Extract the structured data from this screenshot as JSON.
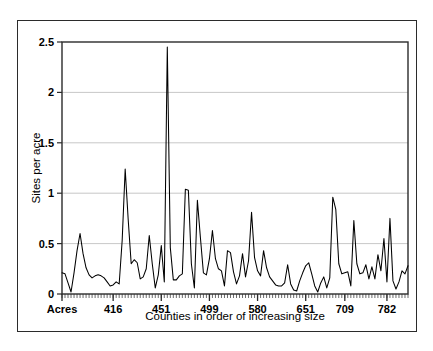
{
  "chart_data": {
    "type": "line",
    "title": "",
    "xlabel": "Counties in order of increasing size",
    "ylabel": "Sites per acre",
    "ylim": [
      0,
      2.5
    ],
    "yticks": [
      0,
      0.5,
      1,
      1.5,
      2,
      2.5
    ],
    "ytick_labels": [
      "0",
      "0.5",
      "1",
      "1.5",
      "2",
      "2.5"
    ],
    "xtick_labels": [
      "Acres",
      "416",
      "451",
      "499",
      "580",
      "651",
      "709",
      "782"
    ],
    "xtick_positions": [
      0,
      17,
      33,
      49,
      65,
      81,
      94,
      108
    ],
    "grid": "horizontal",
    "legend": "none",
    "line_color": "#000000",
    "n_points": 116,
    "values": [
      0.21,
      0.2,
      0.11,
      0.02,
      0.21,
      0.43,
      0.6,
      0.4,
      0.26,
      0.19,
      0.16,
      0.18,
      0.19,
      0.18,
      0.16,
      0.12,
      0.08,
      0.09,
      0.12,
      0.1,
      0.53,
      1.24,
      0.74,
      0.3,
      0.34,
      0.31,
      0.15,
      0.17,
      0.25,
      0.58,
      0.3,
      0.06,
      0.19,
      0.48,
      0.12,
      2.45,
      0.46,
      0.14,
      0.14,
      0.18,
      0.2,
      1.04,
      1.03,
      0.3,
      0.06,
      0.93,
      0.56,
      0.21,
      0.19,
      0.35,
      0.63,
      0.35,
      0.25,
      0.23,
      0.08,
      0.43,
      0.41,
      0.22,
      0.1,
      0.18,
      0.4,
      0.17,
      0.33,
      0.81,
      0.36,
      0.23,
      0.18,
      0.43,
      0.26,
      0.17,
      0.13,
      0.09,
      0.08,
      0.08,
      0.11,
      0.29,
      0.1,
      0.04,
      0.03,
      0.13,
      0.21,
      0.28,
      0.31,
      0.2,
      0.08,
      0.02,
      0.11,
      0.17,
      0.06,
      0.16,
      0.96,
      0.84,
      0.3,
      0.2,
      0.21,
      0.22,
      0.08,
      0.73,
      0.3,
      0.2,
      0.21,
      0.29,
      0.15,
      0.27,
      0.15,
      0.39,
      0.23,
      0.55,
      0.12,
      0.75,
      0.13,
      0.05,
      0.12,
      0.23,
      0.2,
      0.28
    ]
  }
}
